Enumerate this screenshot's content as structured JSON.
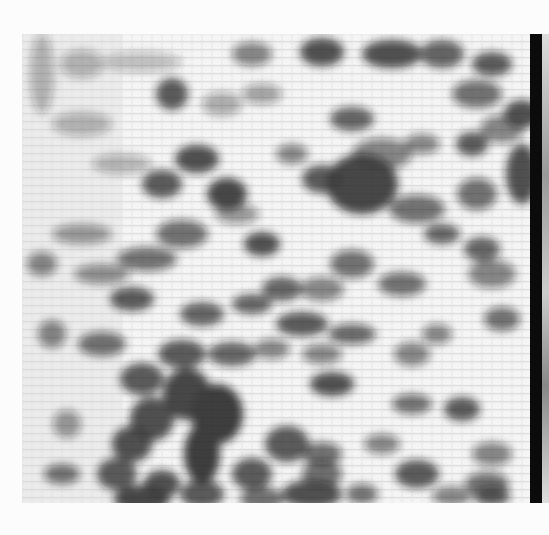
{
  "image": {
    "description": "Grayscale textured mosaic photograph with scattered dark blotches and a dark vertical bar along the right edge",
    "colors": {
      "background": "#fcfcfc",
      "light_tone": "#ececec",
      "mid_tone": "#8a8a8a",
      "dark_tone": "#151515",
      "edge_bar": "#0b0b0b"
    },
    "blobs": [
      [
        60,
        30,
        22,
        14,
        0.35
      ],
      [
        120,
        28,
        40,
        10,
        0.3
      ],
      [
        230,
        20,
        20,
        12,
        0.6
      ],
      [
        300,
        18,
        22,
        14,
        0.9
      ],
      [
        370,
        20,
        30,
        14,
        0.9
      ],
      [
        420,
        20,
        22,
        14,
        0.8
      ],
      [
        470,
        30,
        20,
        12,
        0.85
      ],
      [
        150,
        60,
        16,
        16,
        0.85
      ],
      [
        200,
        70,
        20,
        12,
        0.4
      ],
      [
        240,
        60,
        20,
        10,
        0.45
      ],
      [
        330,
        85,
        22,
        12,
        0.8
      ],
      [
        455,
        60,
        25,
        14,
        0.7
      ],
      [
        500,
        80,
        18,
        14,
        0.9
      ],
      [
        20,
        40,
        12,
        40,
        0.35
      ],
      [
        60,
        90,
        30,
        12,
        0.35
      ],
      [
        100,
        130,
        30,
        10,
        0.35
      ],
      [
        140,
        150,
        20,
        14,
        0.85
      ],
      [
        175,
        125,
        22,
        14,
        0.9
      ],
      [
        205,
        160,
        20,
        16,
        0.95
      ],
      [
        270,
        120,
        16,
        10,
        0.6
      ],
      [
        360,
        120,
        30,
        16,
        0.6
      ],
      [
        400,
        110,
        18,
        10,
        0.6
      ],
      [
        450,
        110,
        16,
        12,
        0.85
      ],
      [
        480,
        95,
        22,
        14,
        0.6
      ],
      [
        340,
        150,
        36,
        30,
        0.95
      ],
      [
        300,
        145,
        20,
        14,
        0.85
      ],
      [
        395,
        175,
        28,
        14,
        0.7
      ],
      [
        455,
        160,
        20,
        16,
        0.7
      ],
      [
        500,
        140,
        16,
        30,
        0.9
      ],
      [
        60,
        200,
        30,
        10,
        0.5
      ],
      [
        160,
        200,
        26,
        14,
        0.7
      ],
      [
        215,
        180,
        22,
        10,
        0.5
      ],
      [
        240,
        210,
        18,
        12,
        0.9
      ],
      [
        330,
        230,
        22,
        14,
        0.7
      ],
      [
        420,
        200,
        18,
        10,
        0.8
      ],
      [
        460,
        215,
        18,
        12,
        0.8
      ],
      [
        20,
        230,
        15,
        12,
        0.6
      ],
      [
        80,
        240,
        28,
        10,
        0.55
      ],
      [
        125,
        225,
        30,
        12,
        0.7
      ],
      [
        260,
        255,
        20,
        12,
        0.8
      ],
      [
        300,
        255,
        22,
        12,
        0.6
      ],
      [
        380,
        250,
        24,
        12,
        0.7
      ],
      [
        470,
        240,
        24,
        14,
        0.6
      ],
      [
        110,
        265,
        22,
        12,
        0.85
      ],
      [
        180,
        280,
        22,
        12,
        0.8
      ],
      [
        230,
        270,
        20,
        10,
        0.8
      ],
      [
        280,
        290,
        26,
        12,
        0.85
      ],
      [
        330,
        300,
        24,
        10,
        0.75
      ],
      [
        480,
        285,
        18,
        12,
        0.7
      ],
      [
        415,
        300,
        15,
        10,
        0.6
      ],
      [
        30,
        300,
        14,
        14,
        0.6
      ],
      [
        80,
        310,
        24,
        12,
        0.7
      ],
      [
        160,
        320,
        24,
        14,
        0.85
      ],
      [
        210,
        320,
        24,
        12,
        0.8
      ],
      [
        250,
        315,
        18,
        10,
        0.6
      ],
      [
        300,
        320,
        20,
        10,
        0.6
      ],
      [
        390,
        320,
        18,
        12,
        0.6
      ],
      [
        120,
        345,
        22,
        16,
        0.85
      ],
      [
        165,
        360,
        24,
        26,
        0.95
      ],
      [
        195,
        380,
        26,
        30,
        1.0
      ],
      [
        130,
        385,
        22,
        22,
        0.9
      ],
      [
        310,
        350,
        22,
        12,
        0.9
      ],
      [
        390,
        370,
        20,
        10,
        0.7
      ],
      [
        440,
        375,
        18,
        12,
        0.85
      ],
      [
        45,
        390,
        14,
        14,
        0.5
      ],
      [
        110,
        410,
        20,
        18,
        0.9
      ],
      [
        180,
        420,
        18,
        30,
        1.0
      ],
      [
        265,
        410,
        22,
        18,
        0.85
      ],
      [
        300,
        420,
        20,
        12,
        0.7
      ],
      [
        360,
        410,
        18,
        10,
        0.6
      ],
      [
        470,
        420,
        20,
        12,
        0.6
      ],
      [
        40,
        440,
        18,
        10,
        0.7
      ],
      [
        95,
        440,
        20,
        16,
        0.85
      ],
      [
        140,
        450,
        18,
        14,
        0.9
      ],
      [
        230,
        440,
        20,
        16,
        0.85
      ],
      [
        300,
        440,
        20,
        14,
        0.7
      ],
      [
        395,
        440,
        22,
        14,
        0.85
      ],
      [
        465,
        450,
        22,
        12,
        0.7
      ],
      [
        120,
        465,
        28,
        14,
        0.95
      ],
      [
        180,
        460,
        22,
        14,
        0.85
      ],
      [
        240,
        465,
        22,
        12,
        0.7
      ],
      [
        290,
        460,
        30,
        14,
        0.9
      ],
      [
        340,
        460,
        16,
        10,
        0.7
      ],
      [
        430,
        462,
        20,
        10,
        0.6
      ],
      [
        470,
        462,
        18,
        10,
        0.85
      ]
    ]
  }
}
